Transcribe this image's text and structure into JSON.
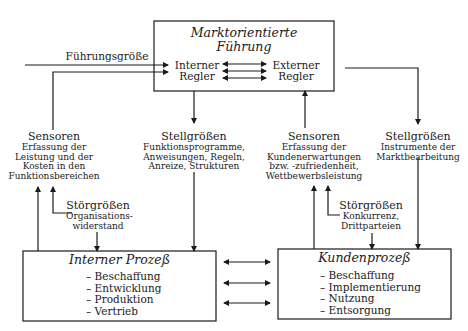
{
  "top_box": {
    "title_line1": "Marktorientierte",
    "title_line2": "Führung",
    "internal_controller": [
      "Interner",
      "Regler"
    ],
    "external_controller": [
      "Externer",
      "Regler"
    ]
  },
  "reference_input": "Führungsgröße",
  "left_sensors": {
    "heading": "Sensoren",
    "lines": [
      "Erfassung der",
      "Leistung und der",
      "Kosten in den",
      "Funktionsbereichen"
    ]
  },
  "left_actuators": {
    "heading": "Stellgrößen",
    "lines": [
      "Funktionsprogramme,",
      "Anweisungen, Regeln,",
      "Anreize, Strukturen"
    ]
  },
  "right_sensors": {
    "heading": "Sensoren",
    "lines": [
      "Erfassung der",
      "Kundenerwartungen",
      "bzw. -zufriedenheit,",
      "Wettbewerbsleistung"
    ]
  },
  "right_actuators": {
    "heading": "Stellgrößen",
    "lines": [
      "Instrumente der",
      "Marktbearbeitung"
    ]
  },
  "left_disturbance": {
    "heading": "Störgrößen",
    "lines": [
      "Organisations-",
      "widerstand"
    ]
  },
  "right_disturbance": {
    "heading": "Störgrößen",
    "lines": [
      "Konkurrenz,",
      "Drittparteien"
    ]
  },
  "internal_process": {
    "title": "Interner Prozeß",
    "items": [
      "– Beschaffung",
      "– Entwicklung",
      "– Produktion",
      "– Vertrieb"
    ]
  },
  "customer_process": {
    "title": "Kundenprozeß",
    "items": [
      "– Beschaffung",
      "– Implementierung",
      "– Nutzung",
      "– Entsorgung"
    ]
  }
}
